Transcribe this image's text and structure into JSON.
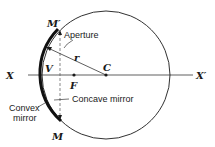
{
  "diagram": {
    "labels": {
      "m_prime": "M′",
      "m": "M",
      "v": "V",
      "c": "C",
      "f": "F",
      "r": "r",
      "x": "X",
      "x_prime": "X′"
    },
    "annotations": {
      "aperture": "Aperture",
      "concave_mirror": "Concave mirror",
      "convex_line1": "Convex",
      "convex_line2": "mirror"
    },
    "colors": {
      "ink": "#1a1a1a",
      "background": "#ffffff"
    }
  }
}
